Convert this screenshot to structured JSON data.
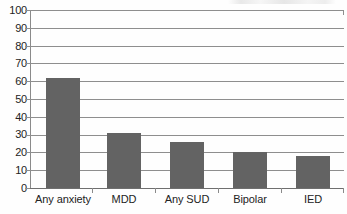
{
  "chart_data": {
    "type": "bar",
    "title": "",
    "subtitle": "",
    "xlabel": "",
    "ylabel": "",
    "categories": [
      "Any anxiety",
      "MDD",
      "Any SUD",
      "Bipolar",
      "IED"
    ],
    "values": [
      62,
      31,
      26,
      20,
      18
    ],
    "ylim": [
      0,
      100
    ],
    "ytick_step": 10,
    "ytick_labels": [
      "100",
      "90",
      "80",
      "70",
      "60",
      "50",
      "40",
      "30",
      "20",
      "10",
      "0"
    ],
    "ytick_values": [
      100,
      90,
      80,
      70,
      60,
      50,
      40,
      30,
      20,
      10,
      0
    ],
    "grid": true,
    "grid_orientation": "horizontal",
    "legend": null,
    "legend_position": "none",
    "series": [
      {
        "name": "",
        "values": [
          62,
          31,
          26,
          20,
          18
        ]
      }
    ],
    "colors": {
      "bar": "#636363",
      "gridline": "#8e8e8e",
      "axis": "#8a8a8a",
      "text": "#232323",
      "background": "#fefefe"
    }
  },
  "figure": {
    "scan_artifact_label": "clipped-text-sliver"
  }
}
